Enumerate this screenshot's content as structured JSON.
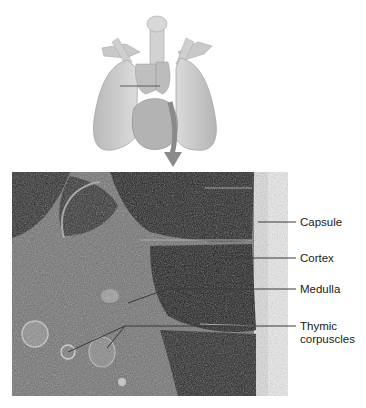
{
  "figure": {
    "illustration": {
      "subject": "thorax-lungs-heart-thymus",
      "section_line": true,
      "pointer": "arrow-down-to-micrograph"
    },
    "micrograph": {
      "subject": "thymus-histology"
    },
    "labels": [
      {
        "id": "capsule",
        "text": "Capsule"
      },
      {
        "id": "cortex",
        "text": "Cortex"
      },
      {
        "id": "medulla",
        "text": "Medulla"
      },
      {
        "id": "thymic",
        "text_line1": "Thymic",
        "text_line2": "corpuscles"
      }
    ],
    "colors": {
      "leader": "#3a3a3a",
      "label_text": "#1a1a1a",
      "tissue_dark": "#1c1c1c",
      "tissue_mid": "#6e6e6e",
      "illustration": "#c8c8c8"
    }
  }
}
